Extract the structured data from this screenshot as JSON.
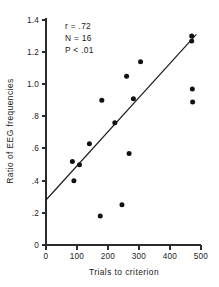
{
  "chart_data": {
    "type": "scatter",
    "title": "",
    "xlabel": "Trials to criterion",
    "ylabel": "Ratio of EEG frequencies",
    "xlim": [
      0,
      500
    ],
    "ylim": [
      0,
      1.4
    ],
    "grid": false,
    "legend": "none",
    "xticks": [
      0,
      100,
      200,
      300,
      400,
      500
    ],
    "xtick_labels": [
      "0",
      "100",
      "200",
      "300",
      "400",
      "500"
    ],
    "yticks": [
      0,
      0.2,
      0.4,
      0.6,
      0.8,
      1.0,
      1.2,
      1.4
    ],
    "ytick_labels": [
      "0",
      ".2",
      ".4",
      ".6",
      ".8",
      "1.0",
      "1.2",
      "1.4"
    ],
    "points": [
      {
        "x": 85,
        "y": 0.52
      },
      {
        "x": 90,
        "y": 0.4
      },
      {
        "x": 108,
        "y": 0.5
      },
      {
        "x": 140,
        "y": 0.63
      },
      {
        "x": 175,
        "y": 0.18
      },
      {
        "x": 180,
        "y": 0.9
      },
      {
        "x": 222,
        "y": 0.76
      },
      {
        "x": 245,
        "y": 0.25
      },
      {
        "x": 260,
        "y": 1.05
      },
      {
        "x": 268,
        "y": 0.57
      },
      {
        "x": 282,
        "y": 0.91
      },
      {
        "x": 305,
        "y": 1.14
      },
      {
        "x": 470,
        "y": 1.3
      },
      {
        "x": 470,
        "y": 1.27
      },
      {
        "x": 472,
        "y": 0.97
      },
      {
        "x": 473,
        "y": 0.89
      }
    ],
    "point_marker": "filled-circle",
    "point_color": "#111111",
    "fit_line": {
      "x_start": 0,
      "y_start": 0.28,
      "x_end": 485,
      "y_end": 1.31,
      "color": "#1a1a1a"
    },
    "annotations": [
      {
        "text": "r = .72"
      },
      {
        "text": "N = 16"
      },
      {
        "text": "P < .01"
      }
    ]
  }
}
